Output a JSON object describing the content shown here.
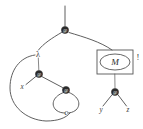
{
  "diagram": {
    "canvas": {
      "width": 143,
      "height": 129
    },
    "colors": {
      "background": "#ffffff",
      "edge": "#4d4d4d",
      "node_fill": "#2b2b2b",
      "node_glyph": "#ffffff",
      "label": "#3a3a3a",
      "box_stroke": "#555555"
    },
    "nodes": [
      {
        "id": "app-root",
        "kind": "application-node",
        "glyph": "@",
        "cx": 65,
        "cy": 30
      },
      {
        "id": "lambda",
        "kind": "lambda-binder",
        "glyph": "λ",
        "cx": 38,
        "cy": 54
      },
      {
        "id": "app-left",
        "kind": "application-node",
        "glyph": "@",
        "cx": 39,
        "cy": 74
      },
      {
        "id": "app-inner",
        "kind": "application-node",
        "glyph": "@",
        "cx": 66,
        "cy": 90
      },
      {
        "id": "app-right",
        "kind": "application-node",
        "glyph": "@",
        "cx": 115,
        "cy": 92
      }
    ],
    "variables": [
      {
        "id": "var-x",
        "label": "x",
        "cx": 22,
        "cy": 87
      },
      {
        "id": "var-c",
        "label": "c",
        "cx": 66,
        "cy": 113
      },
      {
        "id": "var-y",
        "label": "y",
        "cx": 101,
        "cy": 110
      },
      {
        "id": "var-z",
        "label": "z",
        "cx": 128,
        "cy": 110
      }
    ],
    "box": {
      "id": "promotion-box",
      "label": "M",
      "marker": "!",
      "x": 97,
      "y": 50,
      "width": 36,
      "height": 24
    },
    "labels": {
      "lambda": "λ",
      "bang": "!",
      "boxed_term": "M",
      "root_glyph": "@"
    }
  }
}
